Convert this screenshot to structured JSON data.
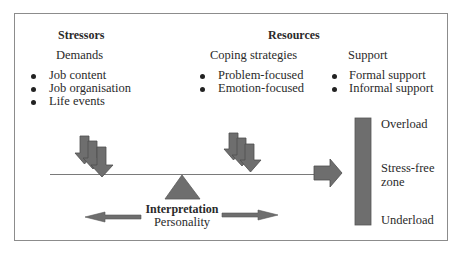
{
  "diagram": {
    "stressors": {
      "heading": "Stressors",
      "subheading": "Demands",
      "items": [
        "Job content",
        "Job organisation",
        "Life events"
      ]
    },
    "resources": {
      "heading": "Resources",
      "coping": {
        "subheading": "Coping strategies",
        "items": [
          "Problem-focused",
          "Emotion-focused"
        ]
      },
      "support": {
        "subheading": "Support",
        "items": [
          "Formal support",
          "Informal support"
        ]
      }
    },
    "fulcrum": {
      "label_bold": "Interpretation",
      "label": "Personality"
    },
    "scale": {
      "top": "Overload",
      "middle_line1": "Stress-free",
      "middle_line2": "zone",
      "bottom": "Underload"
    },
    "colors": {
      "shape_fill": "#6e6e6e",
      "shape_stroke": "#555555",
      "line": "#7a7a7a",
      "frame": "#8c8c8c"
    }
  }
}
